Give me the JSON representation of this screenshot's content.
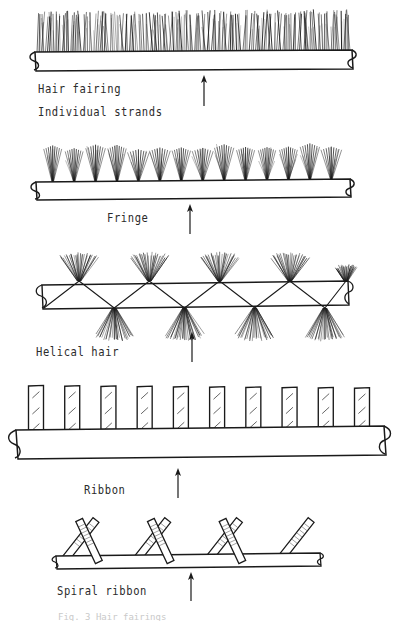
{
  "figure": {
    "caption_partial": "Fig. 3  Hair fairings",
    "background_color": "#ffffff",
    "ink_color": "#1a1a1a",
    "flow_arrow_label": "flow direction arrow"
  },
  "labels": {
    "hair_fairing": "Hair fairing",
    "individual_strands": "Individual strands",
    "fringe": "Fringe",
    "helical_hair": "Helical hair",
    "ribbon": "Ribbon",
    "spiral_ribbon": "Spiral ribbon"
  },
  "panels": [
    {
      "id": "hair-fairing",
      "label": "Hair fairing",
      "sublabel": "Individual strands",
      "treatment": "dense continuous hair strands along entire cable",
      "strand_count": 150,
      "cable_x0": 35,
      "cable_x1": 352,
      "cable_y": 52,
      "cable_height": 19,
      "hair_height": 38,
      "arrow_x": 204,
      "arrow_y_tip": 76,
      "arrow_y_tail": 106
    },
    {
      "id": "fringe",
      "label": "Fringe",
      "treatment": "discrete fan-shaped tufts spaced along cable",
      "tuft_count": 14,
      "strands_per_tuft": 9,
      "cable_x0": 36,
      "cable_x1": 350,
      "cable_y": 181,
      "cable_height": 18,
      "tuft_height": 33,
      "arrow_x": 190,
      "arrow_y_tip": 205,
      "arrow_y_tail": 234
    },
    {
      "id": "helical-hair",
      "label": "Helical hair",
      "treatment": "hair tufts wound helically around cable",
      "turn_count": 4,
      "cable_x0": 42,
      "cable_x1": 348,
      "cable_y": 283,
      "cable_height": 22,
      "arrow_x": 192,
      "arrow_y_tip": 332,
      "arrow_y_tail": 362
    },
    {
      "id": "ribbon",
      "label": "Ribbon",
      "treatment": "flat hatched ribbon tabs standing off cable",
      "ribbon_count": 10,
      "cable_x0": 14,
      "cable_x1": 386,
      "cable_y": 428,
      "cable_height": 29,
      "ribbon_width": 15,
      "ribbon_height": 40,
      "hatch_marks_per_ribbon": 3,
      "arrow_x": 178,
      "arrow_y_tip": 468,
      "arrow_y_tail": 498
    },
    {
      "id": "spiral-ribbon",
      "label": "Spiral ribbon",
      "treatment": "ribbon wound spirally, alternating diagonal strips",
      "strip_count": 7,
      "cable_x0": 55,
      "cable_x1": 320,
      "cable_y": 556,
      "cable_height": 12,
      "arrow_x": 191,
      "arrow_y_tip": 572,
      "arrow_y_tail": 601
    }
  ]
}
